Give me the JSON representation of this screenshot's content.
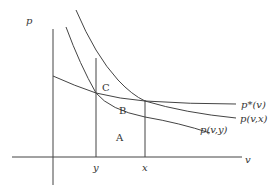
{
  "diagram": {
    "type": "economics-curves",
    "axes": {
      "y_label": "p",
      "x_label": "v",
      "ticks": [
        {
          "name": "y",
          "label": "y"
        },
        {
          "name": "x",
          "label": "x"
        }
      ]
    },
    "curves": [
      {
        "name": "p-star",
        "label": "p*(v)"
      },
      {
        "name": "p-vx",
        "label": "p(v,x)"
      },
      {
        "name": "p-vy",
        "label": "p(v,y)"
      }
    ],
    "regions": [
      {
        "name": "A",
        "label": "A"
      },
      {
        "name": "B",
        "label": "B"
      },
      {
        "name": "C",
        "label": "C"
      }
    ],
    "colors": {
      "line": "#444444",
      "text": "#333333",
      "background": "#ffffff"
    }
  }
}
